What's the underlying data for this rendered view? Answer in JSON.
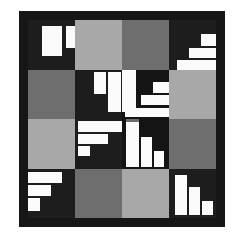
{
  "figure": {
    "type": "grid-mosaic",
    "width": 236,
    "height": 237,
    "background_color": "#ffffff",
    "frame": {
      "color": "#161616",
      "x": 19,
      "y": 11,
      "width": 206,
      "height": 216,
      "inner_pad": 9
    },
    "grid": {
      "rows": 4,
      "cols": 4,
      "x": 9,
      "y": 9,
      "width": 188,
      "height": 198
    }
  },
  "palette": {
    "white": "#fbfbfb",
    "light_gray": "#a8a8a8",
    "mid_gray": "#6e6e6e",
    "dark": "#1d1d1d",
    "darker": "#141414",
    "frame": "#161616",
    "page": "#ffffff"
  },
  "chart_data": {
    "type": "heatmap",
    "xlabel": "",
    "ylabel": "",
    "categories": [
      "c1",
      "c2",
      "c3",
      "c4"
    ],
    "rows": [
      "r1",
      "r2",
      "r3",
      "r4"
    ],
    "grid": false,
    "legend": "none",
    "cells": [
      {
        "id": "r1c1",
        "row": 0,
        "col": 0,
        "fill": "#1d1d1d",
        "bars": [
          {
            "x": 14,
            "y": 6,
            "w": 20,
            "h": 30
          },
          {
            "x": 38,
            "y": 6,
            "w": 17,
            "h": 22
          },
          {
            "x": 59,
            "y": 6,
            "w": 14,
            "h": 42
          }
        ]
      },
      {
        "id": "r1c2",
        "row": 0,
        "col": 1,
        "fill": "#a8a8a8",
        "bars": []
      },
      {
        "id": "r1c3",
        "row": 0,
        "col": 2,
        "fill": "#6e6e6e",
        "bars": []
      },
      {
        "id": "r1c4",
        "row": 0,
        "col": 3,
        "fill": "#1d1d1d",
        "bars": [
          {
            "x": 32,
            "y": 14,
            "w": 15,
            "h": 12
          },
          {
            "x": 20,
            "y": 28,
            "w": 27,
            "h": 10
          },
          {
            "x": 8,
            "y": 40,
            "w": 39,
            "h": 10
          }
        ]
      },
      {
        "id": "r2c1",
        "row": 1,
        "col": 0,
        "fill": "#6e6e6e",
        "bars": []
      },
      {
        "id": "r2c2",
        "row": 1,
        "col": 1,
        "fill": "#1d1d1d",
        "bars": [
          {
            "x": 19,
            "y": 2,
            "w": 12,
            "h": 22
          },
          {
            "x": 33,
            "y": 2,
            "w": 13,
            "h": 40
          }
        ]
      },
      {
        "id": "r2c3",
        "row": 1,
        "col": 2,
        "fill": "#141414",
        "bars": [
          {
            "x": 0,
            "y": 0,
            "w": 14,
            "h": 42
          },
          {
            "x": 31,
            "y": 12,
            "w": 16,
            "h": 11
          },
          {
            "x": 19,
            "y": 25,
            "w": 28,
            "h": 10
          },
          {
            "x": 3,
            "y": 38,
            "w": 44,
            "h": 9
          }
        ]
      },
      {
        "id": "r2c4",
        "row": 1,
        "col": 3,
        "fill": "#a8a8a8",
        "bars": []
      },
      {
        "id": "r3c1",
        "row": 2,
        "col": 0,
        "fill": "#a8a8a8",
        "bars": []
      },
      {
        "id": "r3c2",
        "row": 2,
        "col": 1,
        "fill": "#1d1d1d",
        "bars": [
          {
            "x": 3,
            "y": 2,
            "w": 44,
            "h": 11
          },
          {
            "x": 3,
            "y": 15,
            "w": 30,
            "h": 10
          },
          {
            "x": 3,
            "y": 27,
            "w": 12,
            "h": 10
          }
        ]
      },
      {
        "id": "r3c3",
        "row": 2,
        "col": 2,
        "fill": "#141414",
        "bars": [
          {
            "x": 4,
            "y": 3,
            "w": 13,
            "h": 45
          },
          {
            "x": 19,
            "y": 18,
            "w": 11,
            "h": 30
          },
          {
            "x": 32,
            "y": 32,
            "w": 10,
            "h": 16
          }
        ],
        "accent": {
          "x": 4,
          "y": 0,
          "w": 13,
          "h": 5,
          "fill": "#6e6e6e"
        }
      },
      {
        "id": "r3c4",
        "row": 2,
        "col": 3,
        "fill": "#6e6e6e",
        "bars": []
      },
      {
        "id": "r4c1",
        "row": 3,
        "col": 0,
        "fill": "#1d1d1d",
        "bars": [
          {
            "x": 0,
            "y": 3,
            "w": 34,
            "h": 11
          },
          {
            "x": 0,
            "y": 16,
            "w": 23,
            "h": 11
          },
          {
            "x": 0,
            "y": 29,
            "w": 12,
            "h": 13
          }
        ]
      },
      {
        "id": "r4c2",
        "row": 3,
        "col": 1,
        "fill": "#6e6e6e",
        "bars": []
      },
      {
        "id": "r4c3",
        "row": 3,
        "col": 2,
        "fill": "#a8a8a8",
        "bars": []
      },
      {
        "id": "r4c4",
        "row": 3,
        "col": 3,
        "fill": "#1d1d1d",
        "bars": [
          {
            "x": 6,
            "y": 6,
            "w": 12,
            "h": 40
          },
          {
            "x": 20,
            "y": 18,
            "w": 11,
            "h": 28
          },
          {
            "x": 33,
            "y": 32,
            "w": 11,
            "h": 14
          }
        ]
      }
    ]
  }
}
